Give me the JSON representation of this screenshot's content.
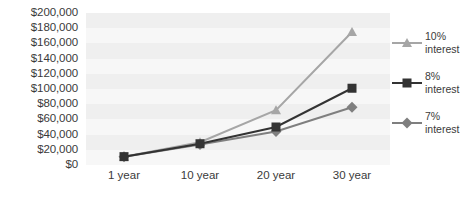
{
  "chart_data": {
    "type": "line",
    "title": "",
    "xlabel": "",
    "ylabel": "",
    "categories": [
      "1 year",
      "10 year",
      "20 year",
      "30 year"
    ],
    "ylim": [
      0,
      200000
    ],
    "ytick_step": 20000,
    "ytick_labels": [
      "$200,000",
      "$180,000",
      "$160,000",
      "$140,000",
      "$120,000",
      "$100,000",
      "$80,000",
      "$60,000",
      "$40,000",
      "$20,000",
      "$0"
    ],
    "ytick_values": [
      200000,
      180000,
      160000,
      140000,
      120000,
      100000,
      80000,
      60000,
      40000,
      20000,
      0
    ],
    "grid": true,
    "grid_style": "horizontal-bands",
    "legend_position": "right",
    "series": [
      {
        "name": "10% interest",
        "percent_label": "10%",
        "word_label": "interest",
        "marker": "triangle",
        "color": "#a6a6a6",
        "values": [
          11000,
          30000,
          72000,
          175000
        ]
      },
      {
        "name": "8% interest",
        "percent_label": "8%",
        "word_label": "interest",
        "marker": "square",
        "color": "#333333",
        "values": [
          11000,
          28000,
          50000,
          101000
        ]
      },
      {
        "name": "7% interest",
        "percent_label": "7%",
        "word_label": "interest",
        "marker": "diamond",
        "color": "#7f7f7f",
        "values": [
          11000,
          27000,
          44000,
          76000
        ]
      }
    ]
  },
  "colors": {
    "plot_background": "#f7f7f7",
    "band": "#efefef",
    "text": "#3a3a3a",
    "series_10": "#a6a6a6",
    "series_8": "#333333",
    "series_7": "#7f7f7f"
  }
}
